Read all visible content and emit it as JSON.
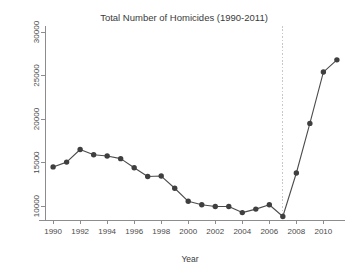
{
  "chart_data": {
    "type": "line",
    "title": "Total Number of Homicides (1990-2011)",
    "xlabel": "Year",
    "ylabel": "",
    "x": [
      1990,
      1991,
      1992,
      1993,
      1994,
      1995,
      1996,
      1997,
      1998,
      1999,
      2000,
      2001,
      2002,
      2003,
      2004,
      2005,
      2006,
      2007,
      2008,
      2009,
      2010,
      2011
    ],
    "values": [
      14500,
      15050,
      16500,
      15900,
      15750,
      15450,
      14400,
      13400,
      13450,
      12050,
      10550,
      10150,
      9950,
      9950,
      9250,
      9650,
      10150,
      8800,
      13800,
      19500,
      25400,
      26800
    ],
    "series": [
      {
        "name": "Total homicides",
        "values": [
          14500,
          15050,
          16500,
          15900,
          15750,
          15450,
          14400,
          13400,
          13450,
          12050,
          10550,
          10150,
          9950,
          9950,
          9250,
          9650,
          10150,
          8800,
          13800,
          19500,
          25400,
          26800
        ]
      }
    ],
    "xlim": [
      1989.4,
      2011.6
    ],
    "ylim": [
      8400,
      30000
    ],
    "xticks": [
      1990,
      1992,
      1994,
      1996,
      1998,
      2000,
      2002,
      2004,
      2006,
      2008,
      2010
    ],
    "xtick_labels": [
      "1990",
      "1992",
      "1994",
      "1996",
      "1998",
      "2000",
      "2002",
      "2004",
      "2006",
      "2008",
      "2010"
    ],
    "yticks": [
      10000,
      15000,
      20000,
      25000,
      30000
    ],
    "ytick_labels": [
      "10000",
      "15000",
      "20000",
      "25000",
      "30000"
    ],
    "grid": false,
    "legend": null,
    "annotations": [
      {
        "name": "reference-line-2007",
        "type": "vertical-dotted-line",
        "x": 2007,
        "color": "#c8c8c8"
      }
    ],
    "colors": {
      "line": "#4c4c4c",
      "marker": "#3f3f3f",
      "axis": "#8d8d8d",
      "reference": "#c8c8c8",
      "background": "#ffffff",
      "text": "#3a3a3a"
    }
  }
}
